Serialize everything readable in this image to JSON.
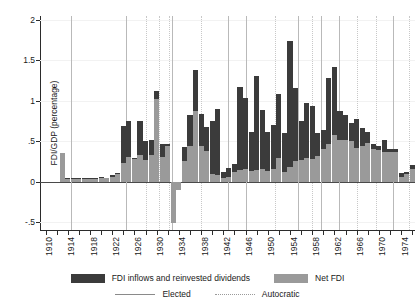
{
  "chart_data": {
    "type": "bar",
    "title": "",
    "subtitle": "",
    "xlabel": "",
    "ylabel": "FDI/GDP (percentage)",
    "ylim": [
      -0.6,
      2.05
    ],
    "xlim": [
      1909.0,
      1976.5
    ],
    "grid": true,
    "stacked": true,
    "legend_position": "bottom",
    "y_ticks": [
      {
        "value": 2,
        "label": "2"
      },
      {
        "value": 1.5,
        "label": "1.5"
      },
      {
        "value": 1,
        "label": "1"
      },
      {
        "value": 0.5,
        "label": ".5"
      },
      {
        "value": 0,
        "label": "0"
      },
      {
        "value": -0.5,
        "label": "-.5"
      }
    ],
    "x_ticks": [
      {
        "value": 1910,
        "label": "1910"
      },
      {
        "value": 1912,
        "label": ""
      },
      {
        "value": 1914,
        "label": "1914"
      },
      {
        "value": 1916,
        "label": ""
      },
      {
        "value": 1918,
        "label": "1918"
      },
      {
        "value": 1920,
        "label": ""
      },
      {
        "value": 1922,
        "label": "1922"
      },
      {
        "value": 1924,
        "label": ""
      },
      {
        "value": 1926,
        "label": "1926"
      },
      {
        "value": 1928,
        "label": ""
      },
      {
        "value": 1930,
        "label": "1930"
      },
      {
        "value": 1932,
        "label": ""
      },
      {
        "value": 1934,
        "label": "1934"
      },
      {
        "value": 1936,
        "label": ""
      },
      {
        "value": 1938,
        "label": "1938"
      },
      {
        "value": 1940,
        "label": ""
      },
      {
        "value": 1942,
        "label": "1942"
      },
      {
        "value": 1944,
        "label": ""
      },
      {
        "value": 1946,
        "label": "1946"
      },
      {
        "value": 1948,
        "label": ""
      },
      {
        "value": 1950,
        "label": "1950"
      },
      {
        "value": 1952,
        "label": ""
      },
      {
        "value": 1954,
        "label": "1954"
      },
      {
        "value": 1956,
        "label": ""
      },
      {
        "value": 1958,
        "label": "1958"
      },
      {
        "value": 1960,
        "label": ""
      },
      {
        "value": 1962,
        "label": "1962"
      },
      {
        "value": 1964,
        "label": ""
      },
      {
        "value": 1966,
        "label": "1966"
      },
      {
        "value": 1968,
        "label": ""
      },
      {
        "value": 1970,
        "label": "1970"
      },
      {
        "value": 1972,
        "label": ""
      },
      {
        "value": 1974,
        "label": "1974"
      },
      {
        "value": 1976,
        "label": ""
      }
    ],
    "series": [
      {
        "name": "FDI inflows and reinvested dividends",
        "color": "#3b3b3b",
        "key": "total"
      },
      {
        "name": "Net FDI",
        "color": "#9a9a9a",
        "key": "net"
      }
    ],
    "x": [
      1910,
      1911,
      1912,
      1913,
      1914,
      1915,
      1916,
      1917,
      1918,
      1919,
      1920,
      1921,
      1922,
      1923,
      1924,
      1925,
      1926,
      1927,
      1928,
      1929,
      1930,
      1931,
      1932,
      1933,
      1934,
      1935,
      1936,
      1937,
      1938,
      1939,
      1940,
      1941,
      1942,
      1943,
      1944,
      1945,
      1946,
      1947,
      1948,
      1949,
      1950,
      1951,
      1952,
      1953,
      1954,
      1955,
      1956,
      1957,
      1958,
      1959,
      1960,
      1961,
      1962,
      1963,
      1964,
      1965,
      1966,
      1967,
      1968,
      1969,
      1970,
      1971,
      1972,
      1973,
      1974,
      1975,
      1976
    ],
    "values_total": [
      null,
      null,
      null,
      0.35,
      0.04,
      0.04,
      0.05,
      0.04,
      0.05,
      0.05,
      0.06,
      0.05,
      0.08,
      0.11,
      0.69,
      0.75,
      0.29,
      0.75,
      0.5,
      0.51,
      1.12,
      0.46,
      0.47,
      -0.51,
      -0.11,
      0.43,
      0.82,
      1.38,
      0.84,
      0.67,
      0.75,
      0.9,
      0.12,
      0.17,
      0.22,
      1.17,
      1.03,
      0.61,
      1.31,
      0.88,
      0.61,
      0.7,
      1.08,
      0.6,
      1.74,
      1.16,
      0.75,
      0.97,
      0.94,
      0.6,
      0.64,
      1.28,
      1.42,
      0.87,
      0.82,
      0.72,
      0.77,
      0.66,
      0.61,
      0.46,
      0.44,
      0.52,
      0.4,
      0.4,
      0.11,
      0.12,
      0.2
    ],
    "values_net": [
      null,
      null,
      null,
      0.35,
      0.03,
      0.03,
      0.03,
      0.03,
      0.03,
      0.03,
      0.04,
      0.04,
      0.06,
      0.09,
      0.23,
      0.3,
      0.28,
      0.33,
      0.27,
      0.33,
      1.02,
      0.3,
      0.44,
      -0.51,
      -0.11,
      0.26,
      0.44,
      0.87,
      0.44,
      0.38,
      0.09,
      0.08,
      0.05,
      0.06,
      0.12,
      0.14,
      0.16,
      0.13,
      0.14,
      0.16,
      0.13,
      0.16,
      0.29,
      0.12,
      0.18,
      0.26,
      0.27,
      0.29,
      0.28,
      0.32,
      0.4,
      0.47,
      0.58,
      0.52,
      0.52,
      0.5,
      0.41,
      0.44,
      0.48,
      0.4,
      0.39,
      0.36,
      0.36,
      0.36,
      0.06,
      0.09,
      0.15
    ],
    "regime_lines": [
      {
        "year": 1914.5,
        "type": "elected"
      },
      {
        "year": 1924.5,
        "type": "elected"
      },
      {
        "year": 1928.0,
        "type": "autocratic"
      },
      {
        "year": 1930.5,
        "type": "autocratic"
      },
      {
        "year": 1932.3,
        "type": "autocratic"
      },
      {
        "year": 1932.8,
        "type": "elected"
      },
      {
        "year": 1938.0,
        "type": "autocratic"
      },
      {
        "year": 1942.8,
        "type": "elected"
      },
      {
        "year": 1946.0,
        "type": "elected"
      },
      {
        "year": 1951.3,
        "type": "autocratic"
      },
      {
        "year": 1955.5,
        "type": "elected"
      },
      {
        "year": 1958.0,
        "type": "autocratic"
      },
      {
        "year": 1959.5,
        "type": "elected"
      },
      {
        "year": 1962.8,
        "type": "elected"
      },
      {
        "year": 1966.0,
        "type": "autocratic"
      },
      {
        "year": 1969.5,
        "type": "autocratic"
      },
      {
        "year": 1972.5,
        "type": "elected"
      },
      {
        "year": 1975.5,
        "type": "autocratic"
      }
    ]
  },
  "legend": {
    "items": [
      {
        "label": "FDI inflows and reinvested dividends",
        "swatch": "dark"
      },
      {
        "label": "Net FDI",
        "swatch": "gray"
      }
    ],
    "lines": [
      {
        "label": "Elected",
        "style": "solid"
      },
      {
        "label": "Autocratic",
        "style": "dotted"
      }
    ]
  }
}
